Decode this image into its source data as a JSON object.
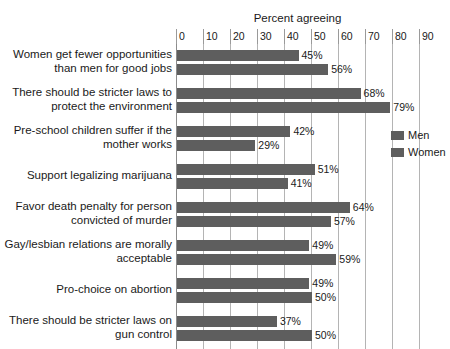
{
  "chart_data": {
    "type": "bar",
    "title": "Percent agreeing",
    "xlabel": "",
    "ylabel": "",
    "orientation": "horizontal",
    "grid": true,
    "legend_position": "right",
    "xlim": [
      0,
      90
    ],
    "xticks": [
      0,
      10,
      20,
      30,
      40,
      50,
      60,
      70,
      80,
      90
    ],
    "xtick_labels": [
      "0",
      "10",
      "20",
      "30",
      "40",
      "50",
      "60",
      "70",
      "80",
      "90"
    ],
    "categories": [
      "Women get fewer opportunities than men for good jobs",
      "There should be stricter laws to protect the environment",
      "Pre-school children suffer if the mother works",
      "Support legalizing marijuana",
      "Favor death penalty for person convicted of murder",
      "Gay/lesbian relations are morally acceptable",
      "Pro-choice on abortion",
      "There should be stricter laws on gun control"
    ],
    "category_lines": [
      [
        "Women get fewer opportunities",
        "than men for good jobs"
      ],
      [
        "There should be stricter laws to",
        "protect the environment"
      ],
      [
        "Pre-school children suffer if the",
        "mother works"
      ],
      [
        "Support legalizing marijuana"
      ],
      [
        "Favor death penalty for person",
        "convicted of murder"
      ],
      [
        "Gay/lesbian relations are morally",
        "acceptable"
      ],
      [
        "Pro-choice on abortion"
      ],
      [
        "There should be stricter laws on",
        "gun control"
      ]
    ],
    "series": [
      {
        "name": "Men",
        "color": "#5e5e5e",
        "values": [
          45,
          68,
          42,
          51,
          64,
          49,
          49,
          37
        ],
        "value_labels": [
          "45%",
          "68%",
          "42%",
          "51%",
          "64%",
          "49%",
          "49%",
          "37%"
        ]
      },
      {
        "name": "Women",
        "color": "#5e5e5e",
        "values": [
          56,
          79,
          29,
          41,
          57,
          59,
          50,
          50
        ],
        "value_labels": [
          "56%",
          "79%",
          "29%",
          "41%",
          "57%",
          "59%",
          "50%",
          "50%"
        ]
      }
    ]
  },
  "legend": {
    "entries": [
      {
        "label": "Men",
        "color": "#5e5e5e"
      },
      {
        "label": "Women",
        "color": "#5e5e5e"
      }
    ]
  },
  "colors": {
    "bar": "#5e5e5e",
    "gridline": "#b4b4b4",
    "axis": "#8c8c8c",
    "text": "#1a1a1a",
    "background": "#ffffff"
  }
}
